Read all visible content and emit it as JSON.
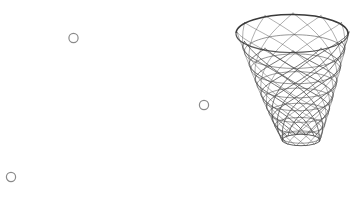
{
  "canvas": {
    "width": 358,
    "height": 210,
    "background": "#ffffff"
  },
  "scene": {
    "title": "Basketball hoop with net and small circles",
    "objects": [
      "basketball-net",
      "circle-marker-1",
      "circle-marker-2",
      "circle-marker-3"
    ]
  },
  "net": {
    "label": "basketball-net",
    "stroke_color": "#4a4a4a",
    "stroke_width": 0.8,
    "rim": {
      "label": "hoop-rim",
      "stroke_color": "#3a3a3a",
      "stroke_width": 1.6,
      "left_x": 236,
      "right_x": 348,
      "left_y": 33,
      "right_y": 34,
      "top_y": 13,
      "front_y": 51,
      "center_x": 293,
      "center_y": 32
    },
    "bottom": {
      "label": "net-bottom-ring",
      "left_x": 282,
      "right_x": 320,
      "y": 140
    },
    "strand_count": 12,
    "mesh_rows": 7,
    "twist_turns": 0.62
  },
  "circles": [
    {
      "label": "circle-marker-1",
      "cx": 73.5,
      "cy": 38,
      "r": 4.6,
      "stroke_color": "#8a8a8a",
      "stroke_width": 1.2,
      "fill": "none"
    },
    {
      "label": "circle-marker-2",
      "cx": 204,
      "cy": 105,
      "r": 4.6,
      "stroke_color": "#8a8a8a",
      "stroke_width": 1.2,
      "fill": "none"
    },
    {
      "label": "circle-marker-3",
      "cx": 11,
      "cy": 177,
      "r": 4.6,
      "stroke_color": "#8a8a8a",
      "stroke_width": 1.2,
      "fill": "none"
    }
  ]
}
